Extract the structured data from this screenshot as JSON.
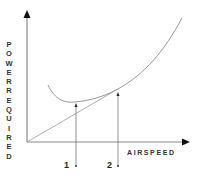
{
  "diagram": {
    "title": "",
    "y_axis_label": "POWER REQUIRED",
    "x_axis_label": "AIRSPEED",
    "markers": [
      {
        "label": "1",
        "meaning": "speed at minimum power required"
      },
      {
        "label": "2",
        "meaning": "speed at tangent from origin"
      }
    ],
    "elements": {
      "curve": "power required curve (U-shaped)",
      "tangent_line": "straight line from origin tangent to curve at point 2"
    },
    "colors": {
      "axis": "#666666",
      "curve": "#888888",
      "text": "#333333"
    }
  }
}
